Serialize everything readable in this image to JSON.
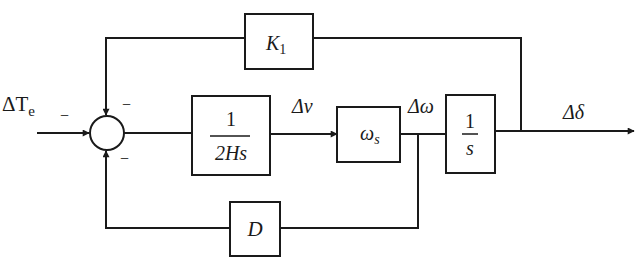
{
  "diagram": {
    "type": "control-block-diagram",
    "input": {
      "symbol": "ΔT",
      "subscript": "e",
      "sign": "−"
    },
    "summing_junction": {
      "inputs": [
        {
          "from": "input ΔTe",
          "sign": "−"
        },
        {
          "from": "K1 feedback (top)",
          "sign": "−"
        },
        {
          "from": "D feedback (bottom)",
          "sign": "−"
        }
      ]
    },
    "blocks": {
      "inertia": {
        "numerator": "1",
        "denominator": "2Hs"
      },
      "speed_gain": {
        "symbol": "ω",
        "subscript": "s"
      },
      "integrator": {
        "numerator": "1",
        "denominator": "s"
      },
      "synchronizing": {
        "symbol": "K",
        "subscript": "1"
      },
      "damping": {
        "symbol": "D"
      }
    },
    "signals": {
      "delta_nu": "Δν",
      "delta_omega": "Δω",
      "delta_delta": "Δδ"
    },
    "signs": {
      "input_minus": "−",
      "top_minus": "−",
      "bottom_minus": "−"
    }
  }
}
